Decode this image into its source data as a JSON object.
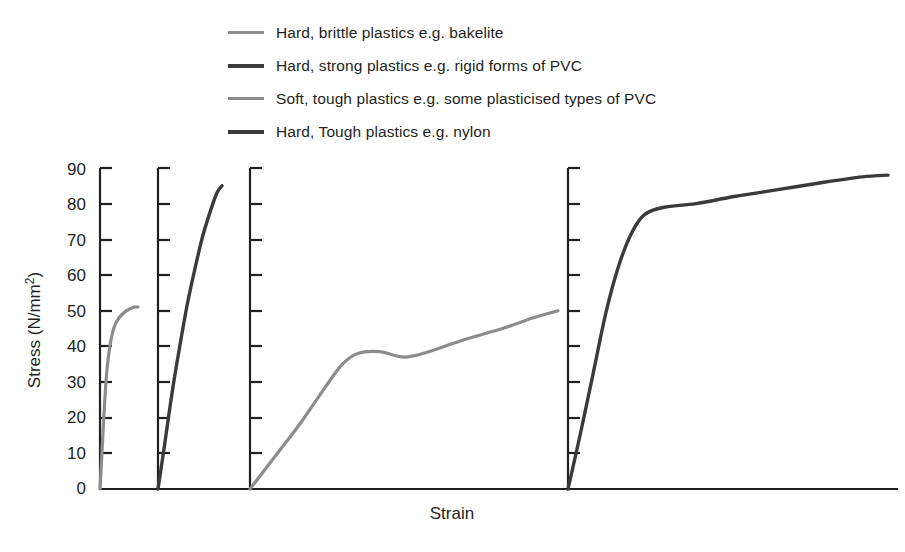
{
  "legend": {
    "items": [
      {
        "label": "Hard, brittle plastics e.g. bakelite",
        "tone": "light",
        "color": "#8c8c8c"
      },
      {
        "label": "Hard, strong plastics e.g. rigid forms of PVC",
        "tone": "dark",
        "color": "#3a3a3a"
      },
      {
        "label": "Soft, tough plastics e.g. some plasticised types of PVC",
        "tone": "light",
        "color": "#8c8c8c"
      },
      {
        "label": "Hard, Tough plastics e.g. nylon",
        "tone": "dark",
        "color": "#3a3a3a"
      }
    ]
  },
  "axes": {
    "ylabel": "Stress (N/mm",
    "ylabel_sup": "2",
    "ylabel_tail": ")",
    "ylabel_full": "Stress (N/mm2)",
    "xlabel": "Strain",
    "yticks": [
      "0",
      "10",
      "20",
      "30",
      "40",
      "50",
      "60",
      "70",
      "80",
      "90"
    ],
    "ylim": [
      0,
      90
    ]
  },
  "chart_data": {
    "type": "line",
    "title": "",
    "xlabel": "Strain",
    "ylabel": "Stress (N/mm2)",
    "ylim": [
      0,
      90
    ],
    "xlim": [
      0,
      1
    ],
    "grid": false,
    "legend_position": "top",
    "note": "Four separate stress-strain panels sharing one vertical stress scale (0-90 N/mm2) and a common Strain axis; strain axis is unlabelled/arbitrary per panel.",
    "panels": [
      {
        "name": "Hard, brittle plastics e.g. bakelite",
        "color": "#8c8c8c",
        "axis_x_px": 100,
        "peak_stress": 51,
        "behaviour": "steep near-linear rise, slight curvature, brittle fracture at about 51 N/mm2",
        "points": [
          [
            0.0,
            0
          ],
          [
            0.06,
            12
          ],
          [
            0.12,
            24
          ],
          [
            0.18,
            33
          ],
          [
            0.26,
            40
          ],
          [
            0.36,
            45
          ],
          [
            0.5,
            48
          ],
          [
            0.7,
            50
          ],
          [
            0.9,
            51
          ],
          [
            1.0,
            51
          ]
        ]
      },
      {
        "name": "Hard, strong plastics e.g. rigid forms of PVC",
        "color": "#3a3a3a",
        "axis_x_px": 158,
        "peak_stress": 85,
        "behaviour": "steep linear rise then gradual curvature to fracture at about 85 N/mm2",
        "points": [
          [
            0.0,
            0
          ],
          [
            0.1,
            12
          ],
          [
            0.22,
            27
          ],
          [
            0.34,
            40
          ],
          [
            0.46,
            52
          ],
          [
            0.58,
            62
          ],
          [
            0.7,
            71
          ],
          [
            0.82,
            78
          ],
          [
            0.92,
            83
          ],
          [
            1.0,
            85
          ]
        ]
      },
      {
        "name": "Soft, tough plastics e.g. some plasticised types of PVC",
        "color": "#8c8c8c",
        "axis_x_px": 250,
        "peak_stress": 50,
        "yield_stress": 38,
        "behaviour": "linear rise to a yield of about 38 N/mm2, small drop to 37, then long gradual strain-hardening to about 50 N/mm2",
        "points": [
          [
            0.0,
            0
          ],
          [
            0.08,
            9
          ],
          [
            0.16,
            18
          ],
          [
            0.24,
            28
          ],
          [
            0.3,
            35
          ],
          [
            0.35,
            38
          ],
          [
            0.42,
            38.5
          ],
          [
            0.5,
            37
          ],
          [
            0.58,
            38.5
          ],
          [
            0.7,
            42
          ],
          [
            0.82,
            45
          ],
          [
            0.92,
            48
          ],
          [
            1.0,
            50
          ]
        ]
      },
      {
        "name": "Hard, Tough plastics e.g. nylon",
        "color": "#3a3a3a",
        "axis_x_px": 568,
        "peak_stress": 88,
        "yield_stress": 78,
        "behaviour": "very steep rise, knee at about 78 N/mm2, short plateau then slow rise to about 88 N/mm2",
        "points": [
          [
            0.0,
            0
          ],
          [
            0.04,
            16
          ],
          [
            0.08,
            33
          ],
          [
            0.12,
            50
          ],
          [
            0.16,
            63
          ],
          [
            0.2,
            72
          ],
          [
            0.24,
            77
          ],
          [
            0.3,
            79
          ],
          [
            0.4,
            80
          ],
          [
            0.52,
            82
          ],
          [
            0.66,
            84
          ],
          [
            0.8,
            86
          ],
          [
            0.92,
            87.5
          ],
          [
            1.0,
            88
          ]
        ]
      }
    ]
  }
}
